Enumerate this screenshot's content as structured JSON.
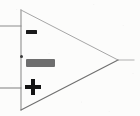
{
  "figure": {
    "background_color": "#fcfcfb",
    "body_stroke_color": "#9a9a9a",
    "wire_stroke_color": "#8c8c8c",
    "glyph_color": "#141414"
  },
  "symbol": {
    "shape": "triangle",
    "orientation": "points-right",
    "apex_top": {
      "x": 21,
      "y": 10
    },
    "apex_bottom": {
      "x": 21,
      "y": 110
    },
    "apex_output": {
      "x": 118,
      "y": 60
    }
  },
  "terminals": {
    "inverting_input": {
      "name": "inverting-input",
      "glyph": "minus-sign",
      "glyph_text": "−",
      "wire_y": 26,
      "wire_x_start": 0,
      "wire_x_end": 21
    },
    "noninverting_input": {
      "name": "noninverting-input",
      "glyph": "plus-sign",
      "glyph_text": "+",
      "wire_y": 88,
      "wire_x_start": 0,
      "wire_x_end": 21
    },
    "output": {
      "name": "output",
      "wire_y": 60,
      "wire_x_start": 118,
      "wire_x_end": 134
    }
  },
  "junction_dot": {
    "name": "junction-dot",
    "x": 21,
    "y": 56
  },
  "label_chip": {
    "text": "",
    "background_color": "#6e6e6e",
    "text_color": "#d8d8d8"
  }
}
